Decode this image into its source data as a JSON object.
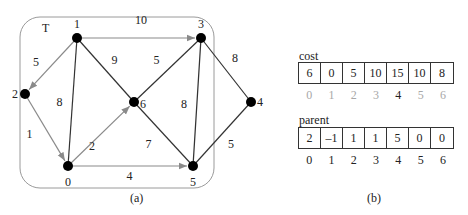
{
  "graph": {
    "tree_label": "T",
    "caption": "(a)",
    "nodes": [
      {
        "id": "0",
        "x": 68,
        "y": 166
      },
      {
        "id": "1",
        "x": 77,
        "y": 38
      },
      {
        "id": "2",
        "x": 25,
        "y": 94
      },
      {
        "id": "3",
        "x": 201,
        "y": 38
      },
      {
        "id": "4",
        "x": 251,
        "y": 102
      },
      {
        "id": "5",
        "x": 193,
        "y": 166
      },
      {
        "id": "6",
        "x": 134,
        "y": 102
      }
    ],
    "edges": [
      {
        "from": "1",
        "to": "3",
        "weight": "10",
        "tree": true
      },
      {
        "from": "1",
        "to": "2",
        "weight": "5",
        "tree": true
      },
      {
        "from": "2",
        "to": "0",
        "weight": "1",
        "tree": true
      },
      {
        "from": "0",
        "to": "6",
        "weight": "2",
        "tree": true
      },
      {
        "from": "0",
        "to": "5",
        "weight": "4",
        "tree": true
      },
      {
        "from": "1",
        "to": "0",
        "weight": "8",
        "tree": false
      },
      {
        "from": "1",
        "to": "6",
        "weight": "9",
        "tree": false
      },
      {
        "from": "3",
        "to": "6",
        "weight": "5",
        "tree": false
      },
      {
        "from": "3",
        "to": "5",
        "weight": "8",
        "tree": false
      },
      {
        "from": "3",
        "to": "4",
        "weight": "8",
        "tree": false
      },
      {
        "from": "6",
        "to": "5",
        "weight": "7",
        "tree": false
      },
      {
        "from": "5",
        "to": "4",
        "weight": "5",
        "tree": false
      }
    ]
  },
  "arrays": {
    "caption": "(b)",
    "cost": {
      "label": "cost",
      "values": [
        "6",
        "0",
        "5",
        "10",
        "15",
        "10",
        "8"
      ],
      "indices": [
        "0",
        "1",
        "2",
        "3",
        "4",
        "5",
        "6"
      ],
      "highlight_index": 4
    },
    "parent": {
      "label": "parent",
      "values": [
        "2",
        "–1",
        "1",
        "1",
        "5",
        "0",
        "0"
      ],
      "indices": [
        "0",
        "1",
        "2",
        "3",
        "4",
        "5",
        "6"
      ]
    }
  },
  "colors": {
    "tree_edge": "#8a8a8a",
    "non_tree_edge": "#333333",
    "node": "#000000",
    "box": "#9a9a9a",
    "grey_index": "#a8a8a8"
  }
}
